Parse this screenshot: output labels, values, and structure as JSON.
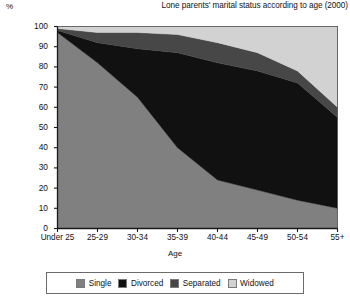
{
  "chart_data": {
    "type": "area",
    "title": "Lone parents' marital status according to age (2000)",
    "subtitle": "",
    "xlabel": "Age",
    "ylabel": "%",
    "ylim": [
      0,
      100
    ],
    "grid": false,
    "stacked": true,
    "legend_position": "bottom",
    "categories": [
      "Under 25",
      "25-29",
      "30-34",
      "35-39",
      "40-44",
      "45-49",
      "50-54",
      "55+"
    ],
    "yticks": [
      0,
      10,
      20,
      30,
      40,
      50,
      60,
      70,
      80,
      90,
      100
    ],
    "ytick_labels": [
      "0",
      "10",
      "20",
      "30",
      "40",
      "50",
      "60",
      "70",
      "80",
      "90",
      "100"
    ],
    "series": [
      {
        "name": "Single",
        "color": "#808080",
        "values": [
          97,
          82,
          65,
          40,
          24,
          19,
          14,
          10
        ]
      },
      {
        "name": "Divorced",
        "color": "#111111",
        "values": [
          1,
          10,
          24,
          47,
          58,
          59,
          58,
          45
        ]
      },
      {
        "name": "Separated",
        "color": "#474747",
        "values": [
          1,
          5,
          8,
          9,
          10,
          9,
          6,
          5
        ]
      },
      {
        "name": "Widowed",
        "color": "#d2d2d2",
        "values": [
          1,
          3,
          3,
          4,
          8,
          13,
          22,
          40
        ]
      }
    ],
    "annotations": []
  },
  "legend": {
    "items": [
      {
        "label": "Single",
        "color": "#808080"
      },
      {
        "label": "Divorced",
        "color": "#111111"
      },
      {
        "label": "Separated",
        "color": "#474747"
      },
      {
        "label": "Widowed",
        "color": "#d2d2d2"
      }
    ]
  },
  "colors": {
    "single": "#808080",
    "divorced": "#111111",
    "separated": "#474747",
    "widowed": "#d2d2d2",
    "axis": "#1a1a1a",
    "background": "#ffffff",
    "plot_border": "#5c5c5c"
  }
}
